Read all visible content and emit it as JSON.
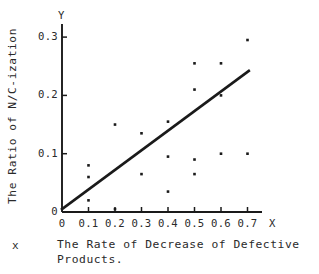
{
  "figure": {
    "y_axis_title": "The Ratio of N/C-ization",
    "x_axis_letter": "X",
    "y_axis_letter": "Y",
    "caption_marker": "x",
    "caption_line1": "The Rate of Decrease of Defective",
    "caption_line2": "Products.",
    "ink_color": "#1a1a1a",
    "background_color": "#ffffff"
  },
  "chart_data": {
    "type": "scatter",
    "title": "",
    "xlabel": "The Rate of Decrease of Defective Products.",
    "ylabel": "The Ratio of N/C-ization",
    "xlim": [
      0,
      0.75
    ],
    "ylim": [
      0,
      0.32
    ],
    "grid": false,
    "legend": null,
    "xticks": [
      0,
      0.1,
      0.2,
      0.3,
      0.4,
      0.5,
      0.6,
      0.7
    ],
    "xtick_labels": [
      "0",
      "0.1",
      "0.2",
      "0.3",
      "0.4",
      "0.5",
      "0.6",
      "0.7"
    ],
    "yticks": [
      0,
      0.1,
      0.2,
      0.3
    ],
    "ytick_labels": [
      "0",
      "0.1",
      "0.2",
      "0.3"
    ],
    "points": [
      {
        "x": 0.1,
        "y": 0.08
      },
      {
        "x": 0.1,
        "y": 0.06
      },
      {
        "x": 0.1,
        "y": 0.02
      },
      {
        "x": 0.2,
        "y": 0.15
      },
      {
        "x": 0.2,
        "y": 0.005
      },
      {
        "x": 0.3,
        "y": 0.135
      },
      {
        "x": 0.3,
        "y": 0.065
      },
      {
        "x": 0.4,
        "y": 0.155
      },
      {
        "x": 0.4,
        "y": 0.095
      },
      {
        "x": 0.4,
        "y": 0.035
      },
      {
        "x": 0.5,
        "y": 0.255
      },
      {
        "x": 0.5,
        "y": 0.21
      },
      {
        "x": 0.5,
        "y": 0.09
      },
      {
        "x": 0.5,
        "y": 0.065
      },
      {
        "x": 0.6,
        "y": 0.255
      },
      {
        "x": 0.6,
        "y": 0.2
      },
      {
        "x": 0.6,
        "y": 0.1
      },
      {
        "x": 0.7,
        "y": 0.295
      },
      {
        "x": 0.7,
        "y": 0.1
      }
    ],
    "trendline": {
      "type": "line",
      "x_start": 0.0,
      "y_start": 0.005,
      "x_end": 0.705,
      "y_end": 0.242
    }
  }
}
